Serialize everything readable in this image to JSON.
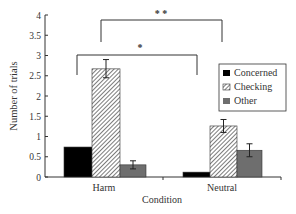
{
  "chart_data": {
    "type": "bar",
    "title": "",
    "xlabel": "Condition",
    "ylabel": "Number of trials",
    "ylim": [
      0,
      4
    ],
    "yticks": [
      "0",
      "0.5",
      "1",
      "1.5",
      "2",
      "2.5",
      "3",
      "3.5",
      "4"
    ],
    "categories": [
      "Harm",
      "Neutral"
    ],
    "series": [
      {
        "name": "Concerned",
        "values": [
          0.74,
          0.12
        ],
        "err_low": [
          null,
          null
        ],
        "err_high": [
          null,
          null
        ],
        "fill": "solid",
        "color": "#000000"
      },
      {
        "name": "Checking",
        "values": [
          2.67,
          1.26
        ],
        "err_low": [
          2.45,
          1.1
        ],
        "err_high": [
          2.9,
          1.42
        ],
        "fill": "hatched",
        "color": "#ffffff"
      },
      {
        "name": "Other",
        "values": [
          0.3,
          0.66
        ],
        "err_low": [
          0.2,
          0.5
        ],
        "err_high": [
          0.4,
          0.82
        ],
        "fill": "solid",
        "color": "#6e6e6e"
      }
    ],
    "legend_position": "right",
    "grid": false,
    "annotations": [
      {
        "type": "significance-bracket",
        "label": "*",
        "from": "Harm-Concerned",
        "to": "Neutral-Concerned"
      },
      {
        "type": "significance-bracket",
        "label": "* *",
        "from": "Harm-Checking",
        "to": "Neutral-Checking"
      }
    ]
  },
  "legend": {
    "items": [
      {
        "label": "Concerned"
      },
      {
        "label": "Checking"
      },
      {
        "label": "Other"
      }
    ]
  },
  "annotations": {
    "lower_bracket_label": "*",
    "upper_bracket_label": "* *"
  }
}
